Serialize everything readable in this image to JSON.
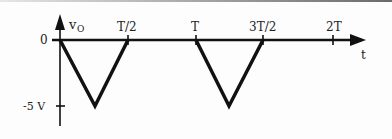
{
  "figure": {
    "y_axis_label": "v",
    "y_axis_label_sub": "O",
    "x_axis_label": "t",
    "origin_label": "0",
    "min_label": "-5 V",
    "x_ticks": [
      "T/2",
      "T",
      "3T/2",
      "2T"
    ]
  },
  "waveform": {
    "description": "Periodic negative triangular pulses reaching -5 V",
    "points": [
      {
        "t": "0",
        "v": 0
      },
      {
        "t": "T/4",
        "v": -5
      },
      {
        "t": "T/2",
        "v": 0
      },
      {
        "t": "T",
        "v": 0
      },
      {
        "t": "5T/4",
        "v": -5
      },
      {
        "t": "3T/2",
        "v": 0
      },
      {
        "t": "2T",
        "v": 0
      }
    ]
  }
}
